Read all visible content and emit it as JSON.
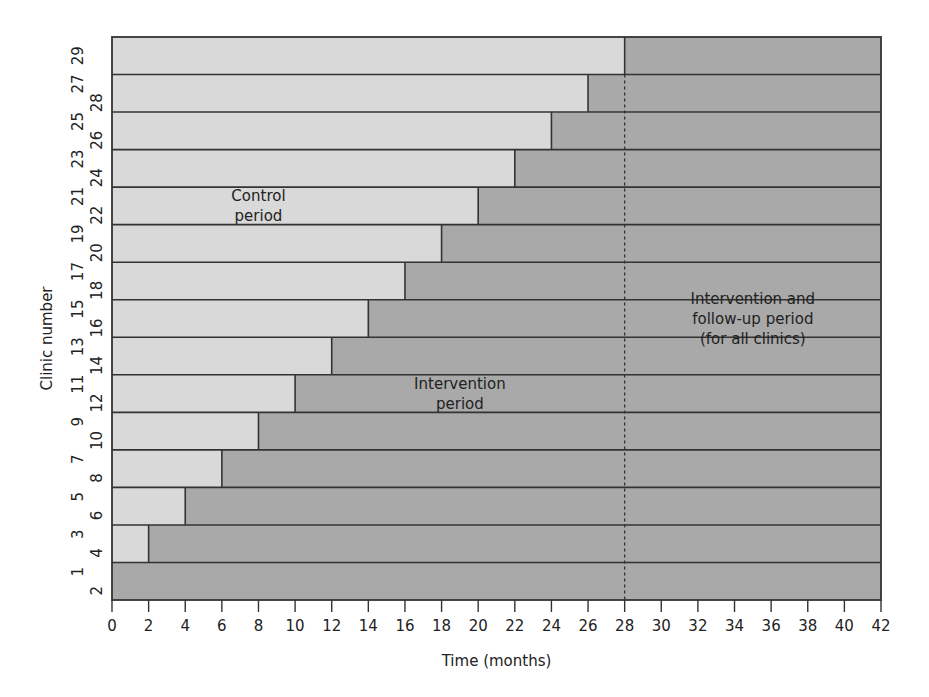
{
  "chart_data": {
    "type": "bar",
    "subtype": "stepped-wedge timeline (horizontal stacked bars)",
    "title": "",
    "xlabel": "Time (months)",
    "ylabel": "Clinic number",
    "xlim": [
      0,
      42
    ],
    "x_ticks": [
      0,
      2,
      4,
      6,
      8,
      10,
      12,
      14,
      16,
      18,
      20,
      22,
      24,
      26,
      28,
      30,
      32,
      34,
      36,
      38,
      40,
      42
    ],
    "grid": false,
    "legend": null,
    "reference_line": {
      "x": 28,
      "style": "dashed"
    },
    "rows": [
      {
        "clinics": [
          "29"
        ],
        "control_end": 28
      },
      {
        "clinics": [
          "27",
          "28"
        ],
        "control_end": 26
      },
      {
        "clinics": [
          "25",
          "26"
        ],
        "control_end": 24
      },
      {
        "clinics": [
          "23",
          "24"
        ],
        "control_end": 22
      },
      {
        "clinics": [
          "21",
          "22"
        ],
        "control_end": 20
      },
      {
        "clinics": [
          "19",
          "20"
        ],
        "control_end": 18
      },
      {
        "clinics": [
          "17",
          "18"
        ],
        "control_end": 16
      },
      {
        "clinics": [
          "15",
          "16"
        ],
        "control_end": 14
      },
      {
        "clinics": [
          "13",
          "14"
        ],
        "control_end": 12
      },
      {
        "clinics": [
          "11",
          "12"
        ],
        "control_end": 10
      },
      {
        "clinics": [
          "9",
          "10"
        ],
        "control_end": 8
      },
      {
        "clinics": [
          "7",
          "8"
        ],
        "control_end": 6
      },
      {
        "clinics": [
          "5",
          "6"
        ],
        "control_end": 4
      },
      {
        "clinics": [
          "3",
          "4"
        ],
        "control_end": 2
      },
      {
        "clinics": [
          "1",
          "2"
        ],
        "control_end": 0
      }
    ],
    "series": [
      {
        "name": "Control period",
        "color": "#d9d9d9"
      },
      {
        "name": "Intervention period",
        "color": "#a9a9a9"
      }
    ],
    "annotations": [
      {
        "lines": [
          "Control",
          "period"
        ],
        "x_month": 8,
        "row_index": 4.5
      },
      {
        "lines": [
          "Intervention",
          "period"
        ],
        "x_month": 19,
        "row_index": 9.5
      },
      {
        "lines": [
          "Intervention and",
          "follow-up period",
          "(for all clinics)"
        ],
        "x_month": 35,
        "row_index": 7.5
      }
    ]
  },
  "colors": {
    "control": "#d9d9d9",
    "intervention": "#a9a9a9",
    "line": "#333333",
    "text": "#222222"
  }
}
